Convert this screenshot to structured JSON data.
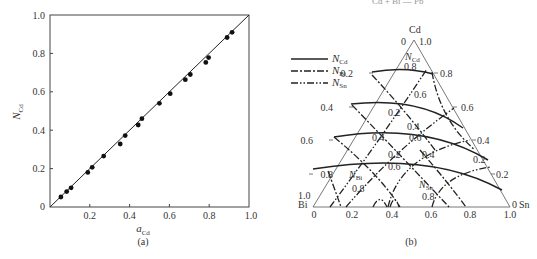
{
  "top_cut_text": "Cd + Bi — Pb",
  "chart_data": [
    {
      "type": "scatter",
      "panel": "(a)",
      "title": "",
      "xlabel": "a_Cd",
      "ylabel": "N_Cd",
      "xlim": [
        0,
        1.0
      ],
      "ylim": [
        0,
        1.0
      ],
      "x_ticks": [
        "0.2",
        "0.4",
        "0.6",
        "0.8",
        "1.0"
      ],
      "y_ticks": [
        "0",
        "0.2",
        "0.4",
        "0.6",
        "0.8",
        "1.0"
      ],
      "grid": false,
      "reference_line": {
        "from": [
          0,
          0
        ],
        "to": [
          1.0,
          1.0
        ],
        "style": "solid"
      },
      "points": [
        {
          "x": 0.055,
          "y": 0.052
        },
        {
          "x": 0.084,
          "y": 0.08
        },
        {
          "x": 0.106,
          "y": 0.1
        },
        {
          "x": 0.19,
          "y": 0.18
        },
        {
          "x": 0.212,
          "y": 0.207
        },
        {
          "x": 0.27,
          "y": 0.265
        },
        {
          "x": 0.353,
          "y": 0.328
        },
        {
          "x": 0.378,
          "y": 0.372
        },
        {
          "x": 0.443,
          "y": 0.427
        },
        {
          "x": 0.462,
          "y": 0.46
        },
        {
          "x": 0.55,
          "y": 0.54
        },
        {
          "x": 0.604,
          "y": 0.59
        },
        {
          "x": 0.68,
          "y": 0.663
        },
        {
          "x": 0.705,
          "y": 0.69
        },
        {
          "x": 0.783,
          "y": 0.753
        },
        {
          "x": 0.797,
          "y": 0.778
        },
        {
          "x": 0.89,
          "y": 0.883
        },
        {
          "x": 0.915,
          "y": 0.91
        }
      ]
    },
    {
      "type": "ternary",
      "panel": "(b)",
      "vertices": {
        "top": "Cd",
        "left": "Bi",
        "right": "Sn"
      },
      "apex_labels": {
        "cd_zero": "0",
        "cd_one": "1.0",
        "bi_one": "1.0",
        "sn_zero": "0"
      },
      "left_edge_ticks": [
        "0.2",
        "0.4",
        "0.6",
        "0.8"
      ],
      "right_edge_ticks": [
        "0.8",
        "0.6",
        "0.4",
        "0.2"
      ],
      "bottom_ticks": [
        "0",
        "0.2",
        "0.4",
        "0.6",
        "0.8",
        "1.0"
      ],
      "legend": [
        {
          "label": "N_Cd",
          "style": "solid"
        },
        {
          "label": "N_Bi",
          "style": "dash-dot"
        },
        {
          "label": "N_Sn",
          "style": "dash-dot-dot"
        }
      ],
      "iso_curves": {
        "N_Cd": [
          "0.8",
          "0.6",
          "0.4",
          "0.2"
        ],
        "N_Bi": [
          "0.8",
          "0.6",
          "0.4",
          "0.2"
        ],
        "N_Sn": [
          "0.8",
          "0.6",
          "0.4",
          "0.2"
        ]
      },
      "curve_labels": [
        "0.8",
        "0.6",
        "0.4",
        "0.2",
        "0.2",
        "0.4",
        "0.6",
        "0.8",
        "0.6",
        "0.4",
        "0.2"
      ]
    }
  ],
  "panel_a": {
    "x_axis_label": "a",
    "x_axis_sub": "Cd",
    "y_axis_label": "N",
    "y_axis_sub": "Cd",
    "caption": "(a)",
    "y_ticks": [
      "0",
      "0.2",
      "0.4",
      "0.6",
      "0.8",
      "1.0"
    ],
    "x_ticks": [
      "0.2",
      "0.4",
      "0.6",
      "0.8",
      "1.0"
    ]
  },
  "panel_b": {
    "caption": "(b)",
    "vertex_cd": "Cd",
    "vertex_bi": "Bi",
    "vertex_sn": "Sn",
    "apex_zero": "0",
    "apex_one": "1.0",
    "bi_one": "1.0",
    "sn_zero": "0",
    "left_ticks": [
      "0.2",
      "0.4",
      "0.6",
      "0.8"
    ],
    "right_ticks": [
      "0.8",
      "0.6",
      "0.4",
      "0.2"
    ],
    "bottom_ticks": [
      "0",
      "0.2",
      "0.4",
      "0.6",
      "0.8",
      "1.0"
    ],
    "legend": {
      "cd": {
        "main": "N",
        "sub": "Cd"
      },
      "bi": {
        "main": "N",
        "sub": "Bi"
      },
      "sn": {
        "main": "N",
        "sub": "Sn"
      }
    },
    "region_labels": {
      "ncd": {
        "main": "N",
        "sub": "Cd"
      },
      "nbi": {
        "main": "N",
        "sub": "Bi"
      },
      "nsn": {
        "main": "N",
        "sub": "Sn"
      }
    },
    "inner_labels": {
      "cd08": "0.8",
      "cd06": "0.6",
      "cd04": "0.4",
      "cd02": "0.2",
      "bi02": "0.2",
      "bi04": "0.4",
      "bi06": "0.6",
      "bi08": "0.8",
      "sn06": "0.6",
      "sn04": "0.4",
      "sn02": "0.2",
      "sn08": "0.8"
    }
  }
}
